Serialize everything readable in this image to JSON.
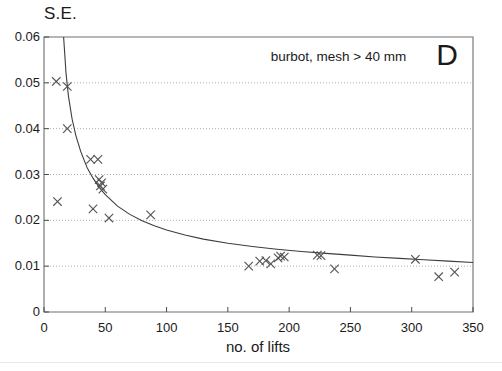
{
  "figure": {
    "panel_label": "D",
    "annotation": "burbot, mesh > 40 mm",
    "y_axis_title": "S.E.",
    "x_axis_title": "no. of lifts"
  },
  "chart_data": {
    "type": "scatter",
    "title": "burbot, mesh > 40 mm",
    "xlabel": "no. of lifts",
    "ylabel": "S.E.",
    "xlim": [
      0,
      350
    ],
    "ylim": [
      0,
      0.06
    ],
    "xticks": [
      0,
      50,
      100,
      150,
      200,
      250,
      300,
      350
    ],
    "yticks": [
      0,
      0.01,
      0.02,
      0.03,
      0.04,
      0.05,
      0.06
    ],
    "xtick_labels": [
      "0",
      "50",
      "100",
      "150",
      "200",
      "250",
      "300",
      "350"
    ],
    "ytick_labels": [
      "0",
      "0.01",
      "0.02",
      "0.03",
      "0.04",
      "0.05",
      "0.06"
    ],
    "grid": "horizontal-dotted",
    "legend": "none",
    "marker": "x",
    "marker_color": "#555555",
    "curve_color": "#3d3d3d",
    "series": [
      {
        "name": "observed S.E.",
        "type": "scatter",
        "points": [
          [
            10,
            0.0503
          ],
          [
            11,
            0.0241
          ],
          [
            19,
            0.0492
          ],
          [
            19,
            0.04
          ],
          [
            38,
            0.0333
          ],
          [
            40,
            0.0225
          ],
          [
            44,
            0.0333
          ],
          [
            45,
            0.0289
          ],
          [
            46,
            0.0275
          ],
          [
            47,
            0.0282
          ],
          [
            48,
            0.0268
          ],
          [
            53,
            0.0205
          ],
          [
            87,
            0.0212
          ],
          [
            167,
            0.01
          ],
          [
            176,
            0.0111
          ],
          [
            181,
            0.0112
          ],
          [
            185,
            0.0105
          ],
          [
            191,
            0.0118
          ],
          [
            193,
            0.0122
          ],
          [
            196,
            0.012
          ],
          [
            223,
            0.0124
          ],
          [
            226,
            0.0123
          ],
          [
            237,
            0.0094
          ],
          [
            303,
            0.0115
          ],
          [
            322,
            0.0077
          ],
          [
            335,
            0.0087
          ]
        ]
      },
      {
        "name": "fitted decay curve",
        "type": "line",
        "points": [
          [
            16,
            0.06
          ],
          [
            18,
            0.052
          ],
          [
            20,
            0.047
          ],
          [
            23,
            0.042
          ],
          [
            26,
            0.0385
          ],
          [
            30,
            0.035
          ],
          [
            35,
            0.0316
          ],
          [
            40,
            0.0292
          ],
          [
            45,
            0.0272
          ],
          [
            50,
            0.0256
          ],
          [
            60,
            0.0231
          ],
          [
            70,
            0.0213
          ],
          [
            80,
            0.0199
          ],
          [
            90,
            0.0188
          ],
          [
            100,
            0.0179
          ],
          [
            115,
            0.0168
          ],
          [
            130,
            0.0159
          ],
          [
            150,
            0.015
          ],
          [
            170,
            0.0143
          ],
          [
            190,
            0.0137
          ],
          [
            210,
            0.0132
          ],
          [
            230,
            0.0128
          ],
          [
            250,
            0.0124
          ],
          [
            270,
            0.012
          ],
          [
            290,
            0.0117
          ],
          [
            310,
            0.0114
          ],
          [
            330,
            0.0111
          ],
          [
            350,
            0.0108
          ]
        ]
      }
    ],
    "annotations": [
      {
        "text": "burbot, mesh > 40 mm",
        "x": 185,
        "y": 0.0555
      },
      {
        "text": "D",
        "x": 320,
        "y": 0.0555
      }
    ]
  }
}
